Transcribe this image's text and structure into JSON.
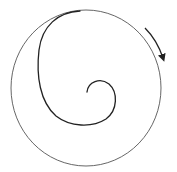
{
  "diagram": {
    "type": "spiral-in-circle",
    "colors": {
      "background": "#ffffff",
      "outer_circle": "#555555",
      "spiral": "#222222",
      "arrow": "#222222"
    },
    "outer_circle": {
      "cx": 86,
      "cy": 88,
      "rx": 75,
      "ry": 78
    },
    "arrow": {
      "direction": "clockwise"
    }
  }
}
